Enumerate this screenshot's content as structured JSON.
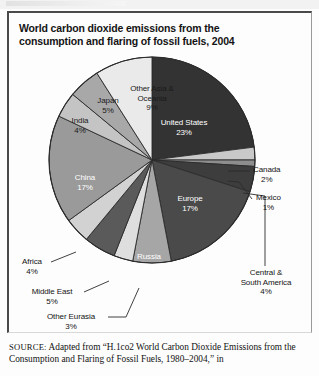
{
  "figure": {
    "title": "World carbon dioxide emissions from the consumption and flaring of fossil fuels, 2004",
    "source_prefix": "SOURCE:",
    "source_text": " Adapted from “H.1co2  World Carbon Dioxide Emissions from the Consumption and Flaring of Fossil Fuels, 1980–2004,” in"
  },
  "chart_data": {
    "type": "pie",
    "title": "World carbon dioxide emissions from the consumption and flaring of fossil fuels, 2004",
    "units": "percent",
    "start_angle_deg": 0,
    "direction": "clockwise",
    "legend": "none",
    "labels_inside": [
      "United States",
      "Europe",
      "Russia",
      "China",
      "India",
      "Japan",
      "Other Asia & Oceania"
    ],
    "labels_outside": [
      "Canada",
      "Mexico",
      "Central & South America",
      "Africa",
      "Middle East",
      "Other Eurasia"
    ],
    "categories": [
      "United States",
      "Canada",
      "Mexico",
      "Central & South America",
      "Europe",
      "Russia",
      "Other Eurasia",
      "Middle East",
      "Africa",
      "China",
      "India",
      "Japan",
      "Other Asia & Oceania"
    ],
    "values": [
      23,
      2,
      1,
      4,
      17,
      6,
      3,
      5,
      4,
      17,
      4,
      5,
      9
    ],
    "slices": [
      {
        "name": "United States",
        "value": 23,
        "label": "United States",
        "pct": "23%",
        "color": "#333333",
        "text_on": "dark"
      },
      {
        "name": "Canada",
        "value": 2,
        "label": "Canada",
        "pct": "2%",
        "color": "#c9c9c9",
        "text_on": "light"
      },
      {
        "name": "Mexico",
        "value": 1,
        "label": "Mexico",
        "pct": "1%",
        "color": "#8e8e8e",
        "text_on": "light"
      },
      {
        "name": "Central & South America",
        "value": 4,
        "label": "Central & South America",
        "pct": "4%",
        "color": "#3d3d3d",
        "text_on": "dark"
      },
      {
        "name": "Europe",
        "value": 17,
        "label": "Europe",
        "pct": "17%",
        "color": "#4a4a4a",
        "text_on": "dark"
      },
      {
        "name": "Russia",
        "value": 6,
        "label": "Russia",
        "pct": "6%",
        "color": "#a6a6a6",
        "text_on": "dark"
      },
      {
        "name": "Other Eurasia",
        "value": 3,
        "label": "Other Eurasia",
        "pct": "3%",
        "color": "#dedede",
        "text_on": "light"
      },
      {
        "name": "Middle East",
        "value": 5,
        "label": "Middle East",
        "pct": "5%",
        "color": "#5a5a5a",
        "text_on": "light"
      },
      {
        "name": "Africa",
        "value": 4,
        "label": "Africa",
        "pct": "4%",
        "color": "#d2d2d2",
        "text_on": "light"
      },
      {
        "name": "China",
        "value": 17,
        "label": "China",
        "pct": "17%",
        "color": "#9a9a9a",
        "text_on": "dark"
      },
      {
        "name": "India",
        "value": 4,
        "label": "India",
        "pct": "4%",
        "color": "#c4c4c4",
        "text_on": "light"
      },
      {
        "name": "Japan",
        "value": 5,
        "label": "Japan",
        "pct": "5%",
        "color": "#a8a8a8",
        "text_on": "light"
      },
      {
        "name": "Other Asia & Oceania",
        "value": 9,
        "label": "Other Asia & Oceania",
        "pct": "9%",
        "color": "#eaeaea",
        "text_on": "light"
      }
    ]
  },
  "inside_labels": {
    "united_states": {
      "name": "United States",
      "pct": "23%"
    },
    "europe": {
      "name": "Europe",
      "pct": "17%"
    },
    "russia": {
      "name": "Russia",
      "pct": "6%"
    },
    "china": {
      "name": "China",
      "pct": "17%"
    },
    "india": {
      "name": "India",
      "pct": "4%"
    },
    "japan": {
      "name": "Japan",
      "pct": "5%"
    },
    "other_asia": {
      "line1": "Other Asia &",
      "line2": "Oceania",
      "pct": "9%"
    }
  },
  "outside_labels": {
    "canada": {
      "name": "Canada",
      "pct": "2%"
    },
    "mexico": {
      "name": "Mexico",
      "pct": "1%"
    },
    "central_south_america": {
      "line1": "Central &",
      "line2": "South America",
      "pct": "4%"
    },
    "africa": {
      "name": "Africa",
      "pct": "4%"
    },
    "middle_east": {
      "name": "Middle East",
      "pct": "5%"
    },
    "other_eurasia": {
      "name": "Other Eurasia",
      "pct": "3%"
    }
  }
}
